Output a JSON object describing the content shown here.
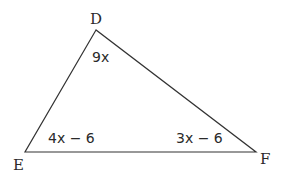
{
  "diagram": {
    "type": "triangle",
    "vertices": [
      {
        "name": "D",
        "x": 96,
        "y": 30
      },
      {
        "name": "E",
        "x": 25,
        "y": 152
      },
      {
        "name": "F",
        "x": 256,
        "y": 152
      }
    ],
    "angle_labels": {
      "D": "9x",
      "E": "4x − 6",
      "F": "3x − 6"
    },
    "stroke_color": "#333333"
  }
}
